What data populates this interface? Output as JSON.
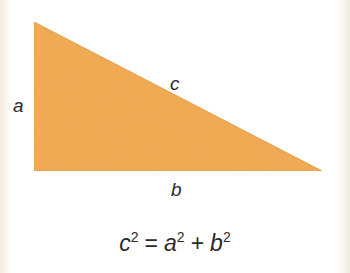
{
  "diagram": {
    "shape": "right-triangle",
    "fill_color": "#f0a851",
    "vertices": {
      "top": [
        34,
        22
      ],
      "right_angle": [
        34,
        171
      ],
      "bottom_right": [
        322,
        171
      ]
    },
    "labels": {
      "side_a": "a",
      "side_b": "b",
      "side_c": "c"
    },
    "formula": {
      "lhs_var": "c",
      "lhs_exp": "2",
      "equals": "=",
      "rhs_var1": "a",
      "rhs_exp1": "2",
      "plus": "+",
      "rhs_var2": "b",
      "rhs_exp2": "2"
    }
  }
}
